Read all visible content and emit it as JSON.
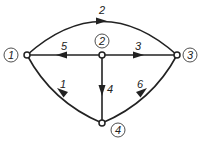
{
  "graph": {
    "nodes": [
      {
        "id": "1",
        "label": "1",
        "x": 27,
        "y": 55,
        "lx": 11,
        "ly": 55
      },
      {
        "id": "2",
        "label": "2",
        "x": 102,
        "y": 55,
        "lx": 102,
        "ly": 41
      },
      {
        "id": "3",
        "label": "3",
        "x": 177,
        "y": 55,
        "lx": 190,
        "ly": 55
      },
      {
        "id": "4",
        "label": "4",
        "x": 102,
        "y": 123,
        "lx": 118,
        "ly": 130
      }
    ],
    "edges": [
      {
        "id": "e1",
        "label": "1",
        "from": "4",
        "to": "1"
      },
      {
        "id": "e2",
        "label": "2",
        "from": "1",
        "to": "3"
      },
      {
        "id": "e3",
        "label": "3",
        "from": "2",
        "to": "3"
      },
      {
        "id": "e4",
        "label": "4",
        "from": "2",
        "to": "4"
      },
      {
        "id": "e5",
        "label": "5",
        "from": "2",
        "to": "1"
      },
      {
        "id": "e6",
        "label": "6",
        "from": "4",
        "to": "3"
      }
    ]
  },
  "colors": {
    "stroke": "#222222",
    "background": "#ffffff"
  }
}
